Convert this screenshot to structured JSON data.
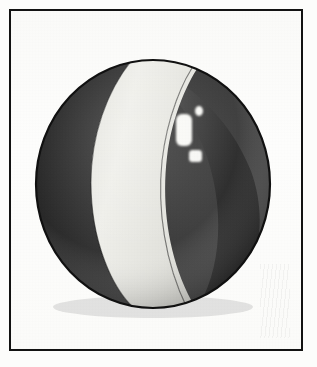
{
  "image": {
    "subject": "beach ball",
    "description": "Monochrome scanned illustration of a beach ball sphere with alternating light and dark panels, inside a thin black rectangular frame",
    "medium": "halftone print scan",
    "caption": ""
  },
  "frame": {
    "name": "rectangular border",
    "stroke_color": "#121212",
    "stroke_width_px": 2.5,
    "left_px": 9,
    "top_px": 9,
    "width_px": 294,
    "height_px": 342,
    "background_color": "#fdfdfc"
  },
  "background": {
    "paper_color": "#fcfcfb",
    "page_width_px": 317,
    "page_height_px": 367
  },
  "ball": {
    "center_x_px": 151,
    "center_y_px": 182,
    "radius_x_px": 117,
    "radius_y_px": 124,
    "outline_color": "#111111",
    "dark_panel_color": "#3a3a3a",
    "dark_panel_shadow_color": "#232323",
    "light_panel_color": "#eeeeea",
    "light_panel_shade_color": "#d8d8d2",
    "rim_highlight_color": "#f7f7f4",
    "panels": [
      {
        "name": "left-dark-gore",
        "tone": "dark"
      },
      {
        "name": "center-light-gore",
        "tone": "light"
      },
      {
        "name": "right-dark-gore",
        "tone": "dark"
      },
      {
        "name": "far-right-light-rim",
        "tone": "light"
      }
    ],
    "highlights": [
      {
        "name": "primary-window-reflection",
        "shape": "rounded-rectangle",
        "cx": 182,
        "cy": 128,
        "w": 16,
        "h": 32
      },
      {
        "name": "small-dot-reflection",
        "shape": "ellipse",
        "cx": 196,
        "cy": 110,
        "w": 8,
        "h": 10
      },
      {
        "name": "lower-square-reflection",
        "shape": "rounded-square",
        "cx": 193,
        "cy": 155,
        "w": 13,
        "h": 12
      }
    ],
    "poles": {
      "top_pole_x_px": 130,
      "top_pole_y_px": 60,
      "bottom_pole_x_px": 188,
      "bottom_pole_y_px": 302
    }
  },
  "artifacts": {
    "smudge_label": "faint vertical scan smudge",
    "smudge_left_px": 258,
    "smudge_top_px": 262
  }
}
